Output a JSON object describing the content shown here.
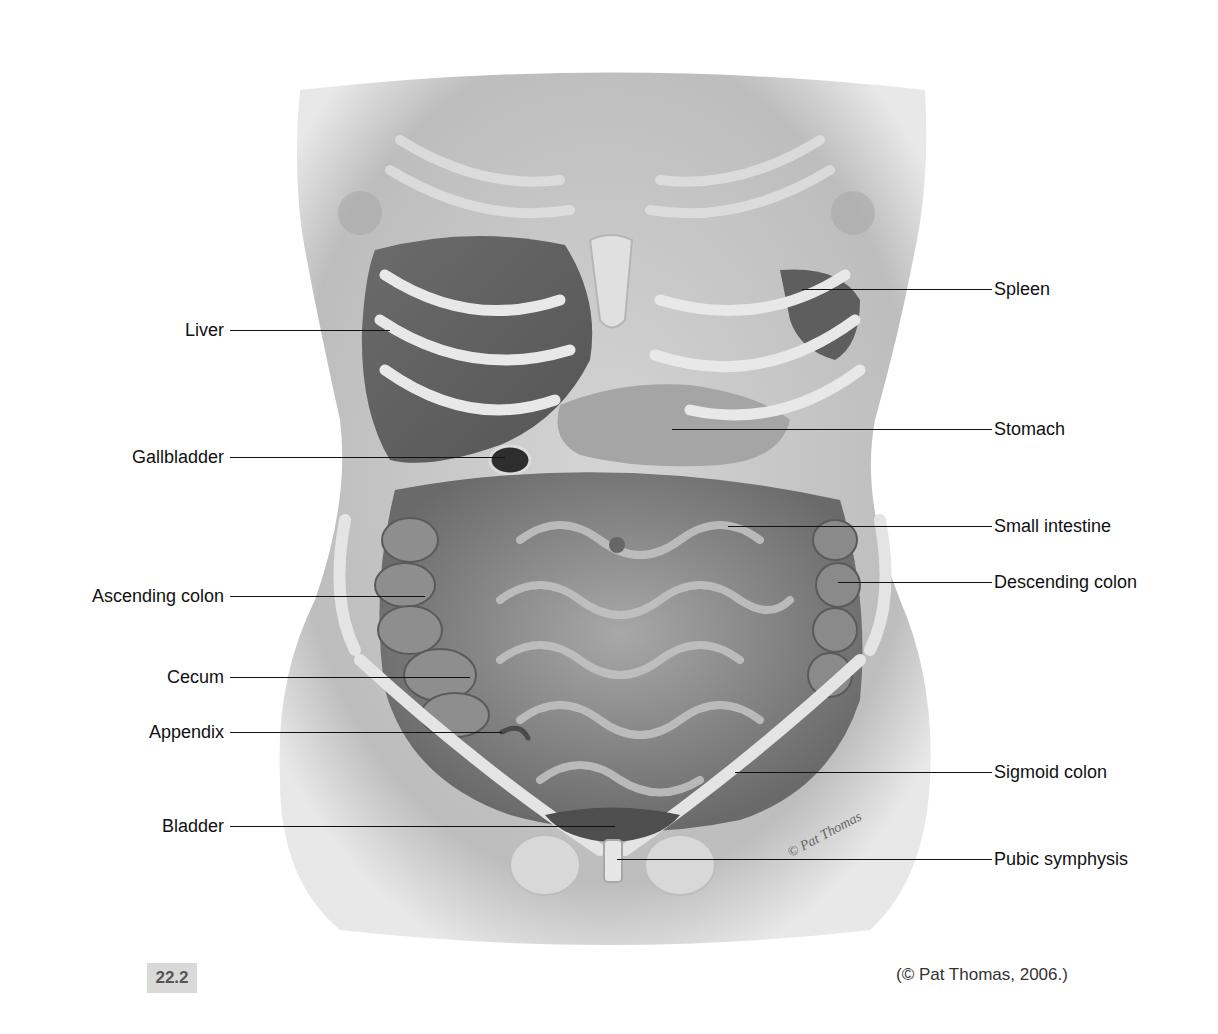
{
  "figure": {
    "number": "22.2",
    "credit": "(© Pat Thomas, 2006.)",
    "signature": "© Pat Thomas",
    "style": "greyscale illustration"
  },
  "labels": {
    "left": [
      {
        "id": "liver",
        "text": "Liver",
        "y": 330,
        "line_end_x": 390
      },
      {
        "id": "gallbladder",
        "text": "Gallbladder",
        "y": 457,
        "line_end_x": 505
      },
      {
        "id": "ascending-colon",
        "text": "Ascending colon",
        "y": 596,
        "line_end_x": 425
      },
      {
        "id": "cecum",
        "text": "Cecum",
        "y": 677,
        "line_end_x": 470
      },
      {
        "id": "appendix",
        "text": "Appendix",
        "y": 732,
        "line_end_x": 502
      },
      {
        "id": "bladder",
        "text": "Bladder",
        "y": 826,
        "line_end_x": 615
      }
    ],
    "right": [
      {
        "id": "spleen",
        "text": "Spleen",
        "y": 289,
        "line_start_x": 802
      },
      {
        "id": "stomach",
        "text": "Stomach",
        "y": 429,
        "line_start_x": 672
      },
      {
        "id": "small-intestine",
        "text": "Small intestine",
        "y": 526,
        "line_start_x": 728
      },
      {
        "id": "descending-colon",
        "text": "Descending colon",
        "y": 582,
        "line_start_x": 838
      },
      {
        "id": "sigmoid-colon",
        "text": "Sigmoid colon",
        "y": 772,
        "line_start_x": 735
      },
      {
        "id": "pubic-symphysis",
        "text": "Pubic symphysis",
        "y": 859,
        "line_start_x": 617
      }
    ]
  },
  "colors": {
    "skin": "#c8c8c8",
    "organ_dark": "#6e6e6e",
    "bone": "#e2e2e2",
    "text": "#111111",
    "fig_box": "#d9d9d9"
  }
}
